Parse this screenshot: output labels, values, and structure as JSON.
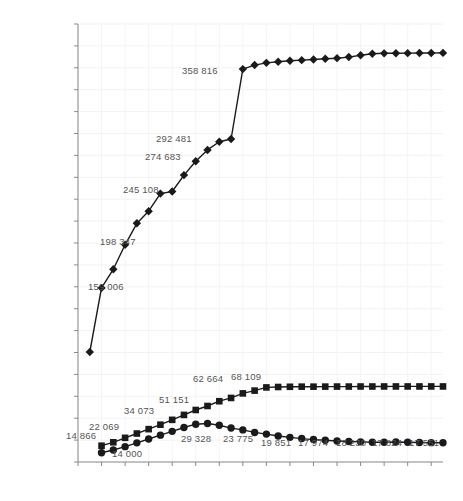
{
  "chart_data": {
    "type": "line",
    "title": "",
    "xlabel": "",
    "ylabel": "人数",
    "ylim": [
      0,
      400000
    ],
    "ytick_step": 20000,
    "grid": true,
    "legend": "none",
    "yticks": [
      "0",
      "20 000",
      "40 000",
      "60 000",
      "80 000",
      "100 000",
      "120 000",
      "140 000",
      "160 000",
      "180 000",
      "200 000",
      "220 000",
      "240 000",
      "260 000",
      "280 000",
      "300 000",
      "320 000",
      "340 000",
      "360 000",
      "380 000",
      "400 000"
    ],
    "x": [
      "12/5月",
      "13",
      "14",
      "15",
      "16",
      "17",
      "18",
      "19",
      "20",
      "21",
      "22",
      "23",
      "24",
      "25",
      "26",
      "27",
      "28",
      "29",
      "30",
      "1/6月",
      "2",
      "3",
      "4",
      "5",
      "6",
      "7",
      "8",
      "9",
      "10",
      "11",
      "12",
      "13"
    ],
    "xticks_shown": [
      "12/5月",
      "14",
      "16",
      "18",
      "20",
      "22",
      "24",
      "26",
      "28",
      "30",
      "1/6月",
      "3",
      "5",
      "7",
      "9",
      "11",
      "13"
    ],
    "series": [
      {
        "name": "series-diamond",
        "marker": "diamond",
        "color": "#1a1a1a",
        "values": [
          null,
          100500,
          159006,
          176000,
          198347,
          218000,
          229000,
          245108,
          247000,
          262000,
          274683,
          285000,
          292481,
          295000,
          358816,
          362500,
          364500,
          365500,
          366500,
          367000,
          367600,
          368200,
          368800,
          369800,
          371500,
          372800,
          373200,
          373300,
          373400,
          373500,
          373500,
          373600
        ]
      },
      {
        "name": "series-square",
        "marker": "square",
        "color": "#1a1a1a",
        "values": [
          null,
          null,
          14866,
          18000,
          22069,
          26000,
          30000,
          34073,
          38500,
          43000,
          47500,
          51151,
          55500,
          58500,
          62664,
          65200,
          68109,
          68500,
          68700,
          68800,
          68800,
          68850,
          68900,
          68900,
          68950,
          68950,
          68980,
          69000,
          69000,
          69000,
          69000,
          69000
        ]
      },
      {
        "name": "series-circle",
        "marker": "circle",
        "color": "#1a1a1a",
        "values": [
          null,
          null,
          8500,
          11000,
          14000,
          17500,
          21000,
          24500,
          28000,
          31500,
          34500,
          35200,
          33500,
          31000,
          29328,
          27000,
          25500,
          23775,
          22500,
          21400,
          20500,
          19851,
          19200,
          18700,
          18400,
          17974,
          18100,
          18230,
          18000,
          17824,
          17650,
          17551
        ]
      }
    ],
    "point_labels": [
      {
        "text": "159 006",
        "series": "series-diamond",
        "index": 2
      },
      {
        "text": "198 347",
        "series": "series-diamond",
        "index": 4
      },
      {
        "text": "245 108",
        "series": "series-diamond",
        "index": 7
      },
      {
        "text": "274 683",
        "series": "series-diamond",
        "index": 10
      },
      {
        "text": "292 481",
        "series": "series-diamond",
        "index": 12
      },
      {
        "text": "358 816",
        "series": "series-diamond",
        "index": 14
      },
      {
        "text": "14 866",
        "series": "series-square",
        "index": 2
      },
      {
        "text": "22 069",
        "series": "series-square",
        "index": 4
      },
      {
        "text": "34 073",
        "series": "series-square",
        "index": 7
      },
      {
        "text": "51 151",
        "series": "series-square",
        "index": 11
      },
      {
        "text": "62 664",
        "series": "series-square",
        "index": 14
      },
      {
        "text": "68 109",
        "series": "series-square",
        "index": 16
      },
      {
        "text": "14 000",
        "series": "series-circle",
        "index": 4
      },
      {
        "text": "29 328",
        "series": "series-circle",
        "index": 14
      },
      {
        "text": "23 775",
        "series": "series-circle",
        "index": 17
      },
      {
        "text": "19 851",
        "series": "series-circle",
        "index": 21
      },
      {
        "text": "17 974",
        "series": "series-circle",
        "index": 25
      },
      {
        "text": "18 230",
        "series": "series-circle",
        "index": 27
      },
      {
        "text": "17 824",
        "series": "series-circle",
        "index": 29
      },
      {
        "text": "17 551",
        "series": "series-circle",
        "index": 31
      }
    ],
    "label_positions": [
      {
        "text": "159 006",
        "x": 88,
        "y": 281
      },
      {
        "text": "198 347",
        "x": 100,
        "y": 236
      },
      {
        "text": "245 108",
        "x": 123,
        "y": 184
      },
      {
        "text": "274 683",
        "x": 145,
        "y": 151
      },
      {
        "text": "292 481",
        "x": 156,
        "y": 133
      },
      {
        "text": "358 816",
        "x": 182,
        "y": 65
      },
      {
        "text": "14 866",
        "x": 66,
        "y": 430
      },
      {
        "text": "22 069",
        "x": 89,
        "y": 421
      },
      {
        "text": "34 073",
        "x": 124,
        "y": 405
      },
      {
        "text": "51 151",
        "x": 159,
        "y": 394
      },
      {
        "text": "62 664",
        "x": 193,
        "y": 373
      },
      {
        "text": "68 109",
        "x": 231,
        "y": 371
      },
      {
        "text": "14 000",
        "x": 112,
        "y": 448
      },
      {
        "text": "29 328",
        "x": 181,
        "y": 433
      },
      {
        "text": "23 775",
        "x": 223,
        "y": 433
      },
      {
        "text": "19 851",
        "x": 261,
        "y": 437
      },
      {
        "text": "17 974",
        "x": 298,
        "y": 437
      },
      {
        "text": "18 230",
        "x": 336,
        "y": 437
      },
      {
        "text": "17 824",
        "x": 372,
        "y": 437
      },
      {
        "text": "17 551",
        "x": 409,
        "y": 437
      }
    ]
  },
  "axis": {
    "y_title": "人数"
  }
}
